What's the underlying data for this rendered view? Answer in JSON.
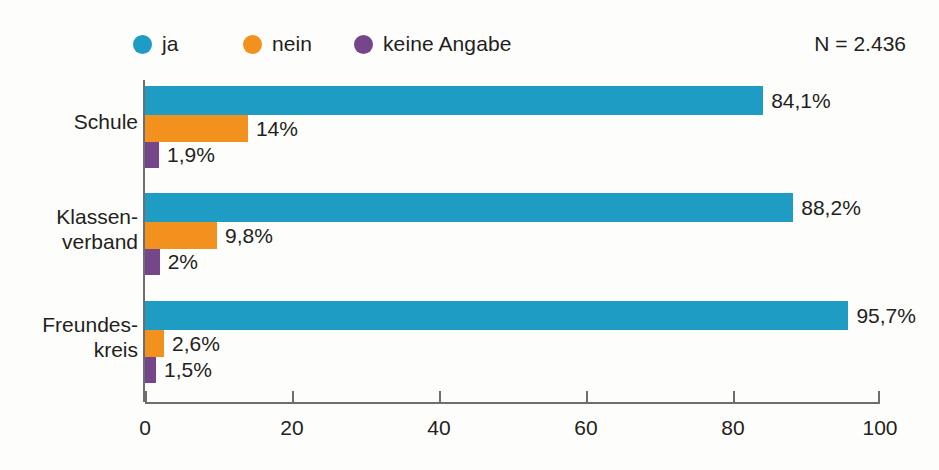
{
  "chart_data": {
    "type": "bar",
    "orientation": "horizontal",
    "title": "",
    "subtitle": "",
    "xlabel": "",
    "ylabel": "",
    "xlim": [
      0,
      100
    ],
    "xticks": [
      0,
      20,
      40,
      60,
      80,
      100
    ],
    "xtick_labels": [
      "0",
      "20",
      "40",
      "60",
      "80",
      "100"
    ],
    "grid": false,
    "legend_position": "top-left",
    "categories": [
      "Schule",
      "Klassen-\nverband",
      "Freundes-\nkreis"
    ],
    "category_lines": [
      [
        "Schule"
      ],
      [
        "Klassen-",
        "verband"
      ],
      [
        "Freundes-",
        "kreis"
      ]
    ],
    "series": [
      {
        "name": "ja",
        "color": "#1f9cc4",
        "values": [
          84.1,
          88.2,
          95.7
        ],
        "labels": [
          "84,1%",
          "88,2%",
          "95,7%"
        ]
      },
      {
        "name": "nein",
        "color": "#f2911d",
        "values": [
          14,
          9.8,
          2.6
        ],
        "labels": [
          "14%",
          "9,8%",
          "2,6%"
        ]
      },
      {
        "name": "keine Angabe",
        "color": "#75468a",
        "values": [
          1.9,
          2,
          1.5
        ],
        "labels": [
          "1,9%",
          "2%",
          "1,5%"
        ]
      }
    ],
    "annotations": [
      {
        "name": "sample-size",
        "text": "N = 2.436"
      }
    ]
  },
  "legend": {
    "items": [
      {
        "label": "ja",
        "color": "#1f9cc4",
        "icon": "circle-icon"
      },
      {
        "label": "nein",
        "color": "#f2911d",
        "icon": "circle-icon"
      },
      {
        "label": "keine Angabe",
        "color": "#75468a",
        "icon": "circle-icon"
      }
    ]
  },
  "sample_size": {
    "text": "N = 2.436"
  },
  "colors": {
    "ja": "#1f9cc4",
    "nein": "#f2911d",
    "keine_angabe": "#75468a",
    "axis": "#6d6e71",
    "text": "#231f20",
    "background": "#fdfdfb"
  }
}
